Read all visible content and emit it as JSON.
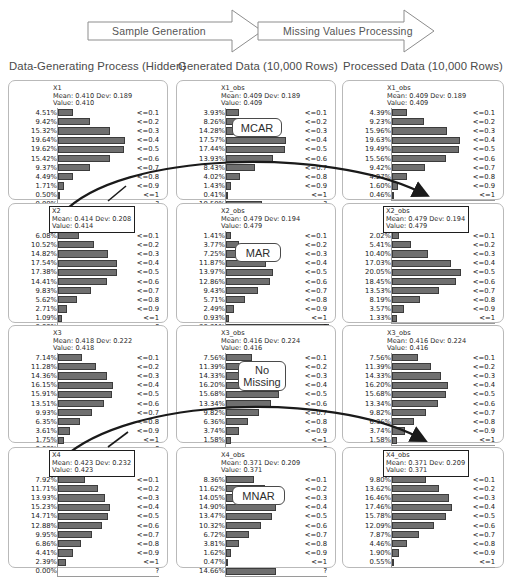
{
  "banner": {
    "steps": [
      {
        "label": "Sample Generation"
      },
      {
        "label": "Missing Values Processing"
      }
    ]
  },
  "columns": [
    {
      "heading": "Data-Generating Process (Hidden)"
    },
    {
      "heading": "Generated Data (10,000 Rows)"
    },
    {
      "heading": "Processed Data (10,000 Rows)"
    }
  ],
  "bin_labels": [
    "<=0.1",
    "<=0.2",
    "<=0.3",
    "<=0.4",
    "<=0.5",
    "<=0.6",
    "<=0.7",
    "<=0.8",
    "<=0.9",
    "<=1",
    "?"
  ],
  "mechanisms": [
    {
      "name": "mcar-chip",
      "label": "MCAR"
    },
    {
      "name": "mar-chip",
      "label": "MAR"
    },
    {
      "name": "no-missing-chip",
      "label": "No\nMissing"
    },
    {
      "name": "mnar-chip",
      "label": "MNAR"
    }
  ],
  "colors": {
    "bar": "#6f6f6f",
    "bar_border": "#3c3c3c",
    "panel_border": "#b9b9b9",
    "highlight_border": "#1e1e1e",
    "arrow": "#1a1a1a",
    "text": "#1c1c1c"
  },
  "chart_data": [
    {
      "type": "bar",
      "name": "X1-hidden",
      "title": "X1",
      "stats": "Mean: 0.410 Dev: 0.189",
      "value": "Value: 0.410",
      "highlighted": false,
      "categories": [
        "<=0.1",
        "<=0.2",
        "<=0.3",
        "<=0.4",
        "<=0.5",
        "<=0.6",
        "<=0.7",
        "<=0.8",
        "<=0.9",
        "<=1",
        "?"
      ],
      "labels": [
        "4.51%",
        "9.42%",
        "15.32%",
        "19.64%",
        "19.62%",
        "15.42%",
        "9.37%",
        "4.49%",
        "1.71%",
        "0.50%",
        "0.00%"
      ],
      "values": [
        4.51,
        9.42,
        15.32,
        19.64,
        19.62,
        15.42,
        9.37,
        4.49,
        1.71,
        0.5,
        0.0
      ],
      "xlabel": "",
      "ylabel": "",
      "xlim": [
        0,
        31
      ]
    },
    {
      "type": "bar",
      "name": "X1-generated",
      "title": "X1_obs",
      "stats": "Mean: 0.409 Dev: 0.189",
      "value": "Value: 0.409",
      "highlighted": false,
      "categories": [
        "<=0.1",
        "<=0.2",
        "<=0.3",
        "<=0.4",
        "<=0.5",
        "<=0.6",
        "<=0.7",
        "<=0.8",
        "<=0.9",
        "<=1",
        "?"
      ],
      "labels": [
        "3.93%",
        "8.26%",
        "14.28%",
        "17.57%",
        "17.44%",
        "13.93%",
        "8.43%",
        "4.02%",
        "1.43%",
        "0.41%",
        "10.50%"
      ],
      "values": [
        3.93,
        8.26,
        14.28,
        17.57,
        17.44,
        13.93,
        8.43,
        4.02,
        1.43,
        0.41,
        10.5
      ],
      "xlabel": "",
      "ylabel": "",
      "xlim": [
        0,
        31
      ]
    },
    {
      "type": "bar",
      "name": "X1-processed",
      "title": "X1_obs",
      "stats": "Mean: 0.409 Dev: 0.189",
      "value": "Value: 0.409",
      "highlighted": false,
      "categories": [
        "<=0.1",
        "<=0.2",
        "<=0.3",
        "<=0.4",
        "<=0.5",
        "<=0.6",
        "<=0.7",
        "<=0.8",
        "<=0.9",
        "<=1"
      ],
      "labels": [
        "4.39%",
        "9.23%",
        "15.96%",
        "19.63%",
        "19.49%",
        "15.56%",
        "9.42%",
        "4.27%",
        "1.60%",
        "0.46%"
      ],
      "values": [
        4.39,
        9.23,
        15.96,
        19.63,
        19.49,
        15.56,
        9.42,
        4.27,
        1.6,
        0.46
      ],
      "xlabel": "",
      "ylabel": "",
      "xlim": [
        0,
        31
      ]
    },
    {
      "type": "bar",
      "name": "X2-hidden",
      "title": "X2",
      "stats": "Mean: 0.414 Dev: 0.208",
      "value": "Value: 0.414",
      "highlighted": true,
      "categories": [
        "<=0.1",
        "<=0.2",
        "<=0.3",
        "<=0.4",
        "<=0.5",
        "<=0.6",
        "<=0.7",
        "<=0.8",
        "<=0.9",
        "<=1",
        "?"
      ],
      "labels": [
        "6.08%",
        "10.52%",
        "14.82%",
        "17.54%",
        "17.38%",
        "14.41%",
        "9.83%",
        "5.62%",
        "2.71%",
        "1.09%",
        "0.00%"
      ],
      "values": [
        6.08,
        10.52,
        14.82,
        17.54,
        17.38,
        14.41,
        9.83,
        5.62,
        2.71,
        1.09,
        0.0
      ],
      "xlabel": "",
      "ylabel": "",
      "xlim": [
        0,
        31
      ]
    },
    {
      "type": "bar",
      "name": "X2-generated",
      "title": "X2_obs",
      "stats": "Mean: 0.479 Dev: 0.194",
      "value": "Value: 0.479",
      "highlighted": false,
      "categories": [
        "<=0.1",
        "<=0.2",
        "<=0.3",
        "<=0.4",
        "<=0.5",
        "<=0.6",
        "<=0.7",
        "<=0.8",
        "<=0.9",
        "<=1",
        "?"
      ],
      "labels": [
        "1.41%",
        "3.77%",
        "7.25%",
        "11.87%",
        "13.97%",
        "12.86%",
        "9.43%",
        "5.71%",
        "2.49%",
        "0.93%",
        "30.31%"
      ],
      "values": [
        1.41,
        3.77,
        7.25,
        11.87,
        13.97,
        12.86,
        9.43,
        5.71,
        2.49,
        0.93,
        30.31
      ],
      "xlabel": "",
      "ylabel": "",
      "xlim": [
        0,
        31
      ]
    },
    {
      "type": "bar",
      "name": "X2-processed",
      "title": "X2_obs",
      "stats": "Mean: 0.479 Dev: 0.194",
      "value": "Value: 0.479",
      "highlighted": true,
      "categories": [
        "<=0.1",
        "<=0.2",
        "<=0.3",
        "<=0.4",
        "<=0.5",
        "<=0.6",
        "<=0.7",
        "<=0.8",
        "<=0.9",
        "<=1"
      ],
      "labels": [
        "2.02%",
        "5.41%",
        "10.40%",
        "17.03%",
        "20.05%",
        "18.45%",
        "13.53%",
        "8.19%",
        "3.57%",
        "1.33%"
      ],
      "values": [
        2.02,
        5.41,
        10.4,
        17.03,
        20.05,
        18.45,
        13.53,
        8.19,
        3.57,
        1.33
      ],
      "xlabel": "",
      "ylabel": "",
      "xlim": [
        0,
        31
      ]
    },
    {
      "type": "bar",
      "name": "X3-hidden",
      "title": "X3",
      "stats": "Mean: 0.418 Dev: 0.222",
      "value": "Value: 0.418",
      "highlighted": false,
      "categories": [
        "<=0.1",
        "<=0.2",
        "<=0.3",
        "<=0.4",
        "<=0.5",
        "<=0.6",
        "<=0.7",
        "<=0.8",
        "<=0.9",
        "<=1",
        "?"
      ],
      "labels": [
        "7.14%",
        "11.28%",
        "14.36%",
        "16.15%",
        "15.91%",
        "13.51%",
        "9.93%",
        "6.35%",
        "3.61%",
        "1.75%",
        "0.00%"
      ],
      "values": [
        7.14,
        11.28,
        14.36,
        16.15,
        15.91,
        13.51,
        9.93,
        6.35,
        3.61,
        1.75,
        0.0
      ],
      "xlabel": "",
      "ylabel": "",
      "xlim": [
        0,
        31
      ]
    },
    {
      "type": "bar",
      "name": "X3-generated",
      "title": "X3_obs",
      "stats": "Mean: 0.416 Dev: 0.224",
      "value": "Value: 0.416",
      "highlighted": false,
      "categories": [
        "<=0.1",
        "<=0.2",
        "<=0.3",
        "<=0.4",
        "<=0.5",
        "<=0.6",
        "<=0.7",
        "<=0.8",
        "<=0.9",
        "<=1",
        "?"
      ],
      "labels": [
        "7.56%",
        "11.39%",
        "14.33%",
        "16.20%",
        "15.68%",
        "13.34%",
        "9.82%",
        "6.36%",
        "3.74%",
        "1.58%",
        ""
      ],
      "values": [
        7.56,
        11.39,
        14.33,
        16.2,
        15.68,
        13.34,
        9.82,
        6.36,
        3.74,
        1.58,
        0.0
      ],
      "xlabel": "",
      "ylabel": "",
      "xlim": [
        0,
        31
      ]
    },
    {
      "type": "bar",
      "name": "X3-processed",
      "title": "X3_obs",
      "stats": "Mean: 0.416 Dev: 0.224",
      "value": "Value: 0.416",
      "highlighted": false,
      "categories": [
        "<=0.1",
        "<=0.2",
        "<=0.3",
        "<=0.4",
        "<=0.5",
        "<=0.6",
        "<=0.7",
        "<=0.8",
        "<=0.9",
        "<=1"
      ],
      "labels": [
        "7.56%",
        "11.39%",
        "14.33%",
        "16.20%",
        "15.68%",
        "13.34%",
        "9.82%",
        "6.36%",
        "3.74%",
        "1.58%"
      ],
      "values": [
        7.56,
        11.39,
        14.33,
        16.2,
        15.68,
        13.34,
        9.82,
        6.36,
        3.74,
        1.58
      ],
      "xlabel": "",
      "ylabel": "",
      "xlim": [
        0,
        31
      ]
    },
    {
      "type": "bar",
      "name": "X4-hidden",
      "title": "X4",
      "stats": "Mean: 0.423 Dev: 0.232",
      "value": "Value: 0.423",
      "highlighted": true,
      "categories": [
        "<=0.1",
        "<=0.2",
        "<=0.3",
        "<=0.4",
        "<=0.5",
        "<=0.6",
        "<=0.7",
        "<=0.8",
        "<=0.9",
        "<=1",
        "?"
      ],
      "labels": [
        "7.92%",
        "11.71%",
        "13.93%",
        "15.23%",
        "14.71%",
        "12.88%",
        "9.95%",
        "6.86%",
        "4.41%",
        "2.39%",
        "0.00%"
      ],
      "values": [
        7.92,
        11.71,
        13.93,
        15.23,
        14.71,
        12.88,
        9.95,
        6.86,
        4.41,
        2.39,
        0.0
      ],
      "xlabel": "",
      "ylabel": "",
      "xlim": [
        0,
        31
      ]
    },
    {
      "type": "bar",
      "name": "X4-generated",
      "title": "X4_obs",
      "stats": "Mean: 0.371 Dev: 0.209",
      "value": "Value: 0.371",
      "highlighted": false,
      "categories": [
        "<=0.1",
        "<=0.2",
        "<=0.3",
        "<=0.4",
        "<=0.5",
        "<=0.6",
        "<=0.7",
        "<=0.8",
        "<=0.9",
        "<=1",
        "?"
      ],
      "labels": [
        "8.36%",
        "11.62%",
        "14.05%",
        "14.90%",
        "13.47%",
        "10.32%",
        "6.72%",
        "3.81%",
        "1.62%",
        "0.47%",
        "14.66%"
      ],
      "values": [
        8.36,
        11.62,
        14.05,
        14.9,
        13.47,
        10.32,
        6.72,
        3.81,
        1.62,
        0.47,
        14.66
      ],
      "xlabel": "",
      "ylabel": "",
      "xlim": [
        0,
        31
      ]
    },
    {
      "type": "bar",
      "name": "X4-processed",
      "title": "X4_obs",
      "stats": "Mean: 0.371 Dev: 0.209",
      "value": "Value: 0.371",
      "highlighted": true,
      "categories": [
        "<=0.1",
        "<=0.2",
        "<=0.3",
        "<=0.4",
        "<=0.5",
        "<=0.6",
        "<=0.7",
        "<=0.8",
        "<=0.9",
        "<=1"
      ],
      "labels": [
        "9.80%",
        "13.62%",
        "16.46%",
        "17.46%",
        "15.78%",
        "12.09%",
        "7.87%",
        "4.46%",
        "1.90%",
        "0.55%"
      ],
      "values": [
        9.8,
        13.62,
        16.46,
        17.46,
        15.78,
        12.09,
        7.87,
        4.46,
        1.9,
        0.55
      ],
      "xlabel": "",
      "ylabel": "",
      "xlim": [
        0,
        31
      ]
    }
  ]
}
